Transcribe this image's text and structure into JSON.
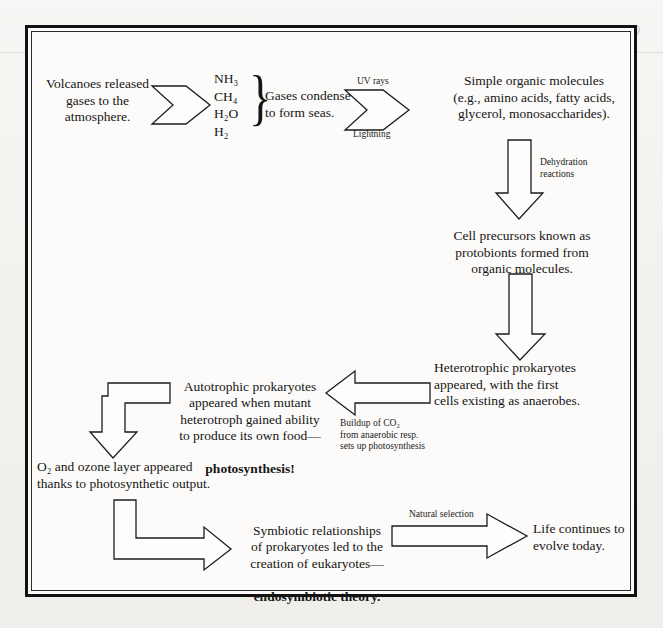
{
  "page": {
    "domain_kind": "flow-diagram",
    "ghost_bleed_text": "Chemical Evolution",
    "frame": {
      "border_color": "#111111",
      "paper_color": "#fcfbf9"
    }
  },
  "nodes": {
    "volcanoes": {
      "text": "Volcanoes released\ngases to the\natmosphere."
    },
    "gases_condense": {
      "text": "Gases condense\nto form seas."
    },
    "simple_organic": {
      "text": "Simple organic molecules\n(e.g., amino acids, fatty acids,\nglycerol, monosaccharides)."
    },
    "protobionts": {
      "text": "Cell precursors known as\nprotobionts formed from\norganic molecules."
    },
    "heterotrophs": {
      "text": "Heterotrophic prokaryotes\nappeared, with the first\ncells existing as anaerobes."
    },
    "autotrophs_line1": {
      "text": "Autotrophic prokaryotes\nappeared when mutant\nheterotroph gained ability\nto produce its own food—"
    },
    "autotrophs_emphasis": {
      "text": "photosynthesis!"
    },
    "ozone": {
      "text": "O₂ and ozone layer appeared\nthanks to photosynthetic output."
    },
    "symbiosis_line1": {
      "text": "Symbiotic relationships\nof prokaryotes led to the\ncreation of eukaryotes—"
    },
    "symbiosis_emphasis": {
      "text": "endosymbiotic theory."
    },
    "life_today": {
      "text": "Life continues to\nevolve today."
    }
  },
  "gas_list": {
    "items": [
      "NH₃",
      "CH₄",
      "H₂O",
      "H₂"
    ],
    "brace": "}"
  },
  "arrow_labels": {
    "uv_rays": "UV rays",
    "lightning": "Lightning",
    "dehydration": "Dehydration\nreactions",
    "co2_buildup": "Buildup of CO₂\nfrom anaerobic resp.\nsets up photosynthesis",
    "natural_selection": "Natural selection"
  },
  "arrows": [
    {
      "name": "arrow-volcanoes-to-gases",
      "style": "chevron-tail-right"
    },
    {
      "name": "arrow-gases-to-organic",
      "style": "chevron-tail-right"
    },
    {
      "name": "arrow-organic-to-protobionts",
      "style": "block-down"
    },
    {
      "name": "arrow-protobionts-to-heterotrophs",
      "style": "block-down"
    },
    {
      "name": "arrow-heterotrophs-to-autotrophs",
      "style": "block-left"
    },
    {
      "name": "arrow-autotrophs-to-ozone",
      "style": "elbow-down"
    },
    {
      "name": "arrow-ozone-to-symbiosis",
      "style": "elbow-right"
    },
    {
      "name": "arrow-symbiosis-to-life",
      "style": "block-right"
    }
  ]
}
